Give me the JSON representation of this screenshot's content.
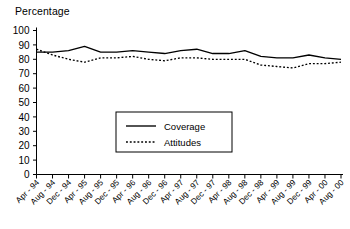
{
  "chart_data": {
    "type": "line",
    "title": "Percentage",
    "xlabel": "",
    "ylabel": "Percentage",
    "ylim": [
      0,
      100
    ],
    "ytick_step": 10,
    "yticks": [
      0,
      10,
      20,
      30,
      40,
      50,
      60,
      70,
      80,
      90,
      100
    ],
    "grid": false,
    "legend_position": "center-bottom-inside",
    "categories": [
      "Apr - 94",
      "Aug - 94",
      "Dec - 94",
      "Apr - 95",
      "Aug - 95",
      "Dec - 95",
      "Apr - 96",
      "Aug - 96",
      "Dec - 96",
      "Apr - 97",
      "Aug - 97",
      "Dec - 97",
      "Apr - 98",
      "Aug - 98",
      "Dec - 98",
      "Apr - 99",
      "Aug - 99",
      "Dec - 99",
      "Apr - 00",
      "Aug - 00"
    ],
    "series": [
      {
        "name": "Coverage",
        "style": "solid",
        "color": "#000000",
        "values": [
          85,
          85,
          86,
          89,
          85,
          85,
          86,
          85,
          84,
          86,
          87,
          84,
          84,
          86,
          82,
          81,
          81,
          83,
          81,
          80
        ]
      },
      {
        "name": "Attitudes",
        "style": "dotted",
        "color": "#000000",
        "values": [
          87,
          83,
          80,
          78,
          81,
          81,
          82,
          80,
          79,
          81,
          81,
          80,
          80,
          80,
          76,
          75,
          74,
          77,
          77,
          78
        ]
      }
    ]
  },
  "legend": {
    "entries": [
      {
        "label": "Coverage"
      },
      {
        "label": "Attitudes"
      }
    ]
  }
}
